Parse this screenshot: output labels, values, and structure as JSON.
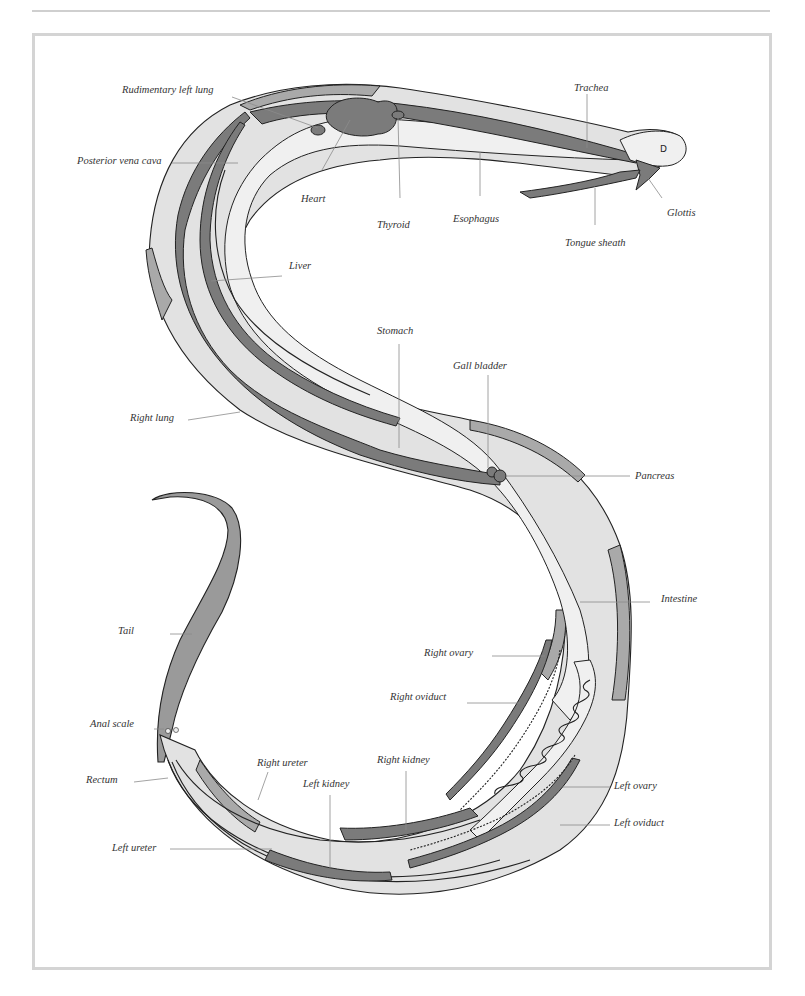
{
  "diagram": {
    "colors": {
      "body_fill": "#e2e2e2",
      "organ_dark": "#7b7b7b",
      "organ_mid": "#a9a9a9",
      "organ_light": "#f0f0f0",
      "frame": "#d4d4d4",
      "label_text": "#333333",
      "leader_line": "#8c8c8c"
    },
    "labels": {
      "rudimentary_left_lung": "Rudimentary left lung",
      "posterior_vena_cava": "Posterior vena cava",
      "heart": "Heart",
      "thyroid": "Thyroid",
      "esophagus": "Esophagus",
      "trachea": "Trachea",
      "glottis": "Glottis",
      "tongue_sheath": "Tongue sheath",
      "liver": "Liver",
      "stomach": "Stomach",
      "gall_bladder": "Gall bladder",
      "right_lung": "Right lung",
      "pancreas": "Pancreas",
      "intestine": "Intestine",
      "tail": "Tail",
      "right_ovary": "Right ovary",
      "right_oviduct": "Right oviduct",
      "anal_scale": "Anal scale",
      "right_ureter": "Right ureter",
      "right_kidney": "Right kidney",
      "rectum": "Rectum",
      "left_kidney": "Left kidney",
      "left_ovary": "Left ovary",
      "left_oviduct": "Left oviduct",
      "left_ureter": "Left ureter"
    }
  }
}
